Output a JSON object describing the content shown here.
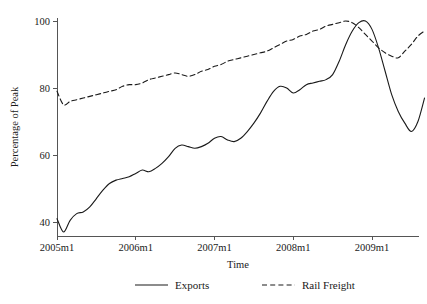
{
  "chart_data": {
    "type": "line",
    "title": "",
    "xlabel": "Time",
    "ylabel": "Percentage of Peak",
    "xlim": [
      0,
      63
    ],
    "ylim": [
      34,
      102
    ],
    "grid": false,
    "legend_position": "bottom",
    "x_tick_labels": [
      "2005m1",
      "2006m1",
      "2007m1",
      "2008m1",
      "2009m1"
    ],
    "x_tick_values": [
      0,
      12,
      24,
      36,
      48
    ],
    "y_tick_labels": [
      "40",
      "60",
      "80",
      "100"
    ],
    "y_tick_values": [
      40,
      60,
      80,
      100
    ],
    "x": [
      0,
      1,
      2,
      3,
      4,
      5,
      6,
      7,
      8,
      9,
      10,
      11,
      12,
      13,
      14,
      15,
      16,
      17,
      18,
      19,
      20,
      21,
      22,
      23,
      24,
      25,
      26,
      27,
      28,
      29,
      30,
      31,
      32,
      33,
      34,
      35,
      36,
      37,
      38,
      39,
      40,
      41,
      42,
      43,
      44,
      45,
      46,
      47,
      48,
      49,
      50,
      51,
      52,
      53,
      54,
      55,
      56
    ],
    "series": [
      {
        "name": "Exports",
        "style": "solid",
        "values": [
          41.0,
          37.0,
          40.5,
          42.5,
          43.0,
          44.5,
          47.0,
          49.5,
          51.5,
          52.5,
          53.0,
          53.5,
          54.5,
          55.5,
          55.0,
          56.0,
          57.5,
          59.5,
          62.0,
          63.0,
          62.5,
          62.0,
          62.5,
          63.5,
          65.0,
          65.5,
          64.5,
          64.0,
          65.0,
          67.0,
          69.5,
          72.5,
          76.0,
          79.0,
          80.5,
          80.0,
          78.5,
          79.5,
          81.0,
          81.5,
          82.0,
          82.5,
          84.0,
          88.0,
          93.0,
          97.0,
          99.5,
          100.0,
          97.5,
          92.0,
          85.0,
          78.0,
          73.0,
          69.5,
          67.0,
          70.0,
          77.0
        ]
      },
      {
        "name": "Rail Freight",
        "style": "dashed",
        "values": [
          79.0,
          75.0,
          76.0,
          76.5,
          77.0,
          77.5,
          78.0,
          78.5,
          79.0,
          79.5,
          80.5,
          81.0,
          81.0,
          81.5,
          82.5,
          83.0,
          83.5,
          84.0,
          84.5,
          84.0,
          83.5,
          84.0,
          85.0,
          85.5,
          86.5,
          87.0,
          88.0,
          88.5,
          89.0,
          89.5,
          90.0,
          90.5,
          91.0,
          92.0,
          93.0,
          94.0,
          94.5,
          95.5,
          96.0,
          97.0,
          97.5,
          98.5,
          99.0,
          99.5,
          100.0,
          99.5,
          98.0,
          96.0,
          94.0,
          92.0,
          90.5,
          89.5,
          89.0,
          91.0,
          93.0,
          95.5,
          97.0
        ]
      }
    ]
  },
  "legend": {
    "items": [
      {
        "label": "Exports",
        "style": "solid"
      },
      {
        "label": "Rail Freight",
        "style": "dashed"
      }
    ]
  }
}
